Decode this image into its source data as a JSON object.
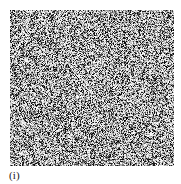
{
  "figure": {
    "caption": "(i)",
    "panel_label": "i",
    "background_color": "#ffffff",
    "image": {
      "name": "random-noise-image",
      "type": "grayscale-random-noise",
      "width_px": 164,
      "height_px": 156,
      "offset_left_px": 10,
      "offset_top_px": 10,
      "pixel_block_size": 1,
      "min_gray": "#000000",
      "max_gray": "#ffffff",
      "mean_gray_level": 150,
      "description": "dense salt-and-pepper grayscale noise field"
    }
  }
}
